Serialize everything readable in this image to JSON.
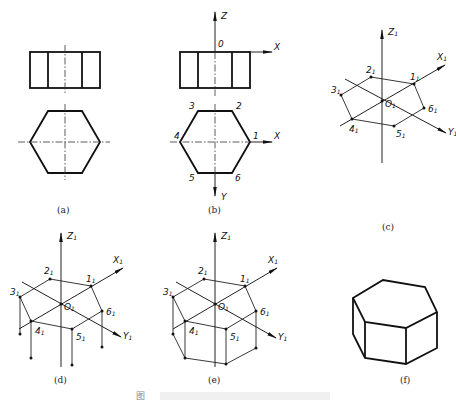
{
  "figure": {
    "caption_partial": "图",
    "panels": [
      {
        "id": "a",
        "caption": "(a)",
        "content": "Front view (rectangle with two inner lines) and top view (regular hexagon) with center lines"
      },
      {
        "id": "b",
        "caption": "(b)",
        "content": "Orthographic views with coordinate axes",
        "axes": {
          "z": "Z",
          "origin": "0",
          "x_front": "X",
          "x_top": "X",
          "y": "Y"
        },
        "points": [
          "1",
          "2",
          "3",
          "4",
          "5",
          "6"
        ]
      },
      {
        "id": "c",
        "caption": "(c)",
        "content": "Isometric axes with top hexagon vertices",
        "axes": {
          "z": "Z1",
          "x": "X1",
          "y": "Y1",
          "origin": "O1"
        },
        "points": [
          "1₁",
          "2₁",
          "3₁",
          "4₁",
          "5₁",
          "6₁"
        ]
      },
      {
        "id": "d",
        "caption": "(d)",
        "content": "Vertical height lines dropped from visible vertices",
        "axes": {
          "z": "Z1",
          "x": "X1",
          "y": "Y1",
          "origin": "O1"
        },
        "points": [
          "1₁",
          "2₁",
          "3₁",
          "4₁",
          "5₁",
          "6₁"
        ]
      },
      {
        "id": "e",
        "caption": "(e)",
        "content": "Bottom edges connected",
        "axes": {
          "z": "Z1",
          "x": "X1",
          "y": "Y1",
          "origin": "O1"
        },
        "points": [
          "1₁",
          "2₁",
          "3₁",
          "4₁",
          "5₁",
          "6₁"
        ]
      },
      {
        "id": "f",
        "caption": "(f)",
        "content": "Finished isometric hexagonal prism"
      }
    ]
  },
  "labels": {
    "b_z": "Z",
    "b_o": "0",
    "b_x1": "X",
    "b_x2": "X",
    "b_y": "Y",
    "b_p1": "1",
    "b_p2": "2",
    "b_p3": "3",
    "b_p4": "4",
    "b_p5": "5",
    "b_p6": "6",
    "axis_z": "Z",
    "axis_x": "X",
    "axis_y": "Y",
    "origin": "O",
    "sub": "1",
    "p1": "1",
    "p2": "2",
    "p3": "3",
    "p4": "4",
    "p5": "5",
    "p6": "6",
    "cap_a": "(a)",
    "cap_b": "(b)",
    "cap_c": "(c)",
    "cap_d": "(d)",
    "cap_e": "(e)",
    "cap_f": "(f)",
    "fig_caption": "图"
  }
}
